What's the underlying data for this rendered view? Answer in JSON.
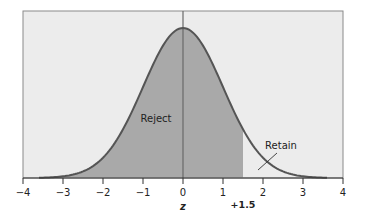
{
  "chart_data": {
    "type": "area",
    "title": "",
    "xlabel": "z",
    "ylabel": "",
    "xlim": [
      -4,
      4
    ],
    "xticks": [
      -4,
      -3,
      -2,
      -1,
      0,
      1,
      2,
      3,
      4
    ],
    "xtick_labels": [
      "−4",
      "−3",
      "−2",
      "−1",
      "0",
      "1",
      "2",
      "3",
      "4"
    ],
    "distribution": "standard normal",
    "curve_range": [
      -3.6,
      3.6
    ],
    "shaded_region": {
      "from": -3.6,
      "to": 1.5,
      "label": "Reject"
    },
    "unshaded_region": {
      "from": 1.5,
      "to": 3.6,
      "label": "Retain"
    },
    "critical_value": {
      "value": 1.5,
      "label": "+1.5"
    },
    "reference_line": 0,
    "grid": false,
    "legend": "none"
  },
  "labels": {
    "reject": "Reject",
    "retain": "Retain",
    "critical": "+1.5",
    "xaxis": "z"
  },
  "colors": {
    "background": "#ececec",
    "shaded": "#a9a9a9",
    "curve": "#5a5a5a",
    "frame": "#8a8a8a",
    "axis": "#333333"
  }
}
